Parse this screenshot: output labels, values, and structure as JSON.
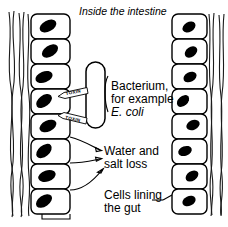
{
  "diagram": {
    "title": "Inside the intestine",
    "background_color": "#ffffff",
    "ink_color": "#000000",
    "labels": {
      "bacterium_line1": "Bacterium,",
      "bacterium_line2": "for example",
      "bacterium_line3": "E. coli",
      "water_salt_line1": "Water and",
      "water_salt_line2": "salt loss",
      "cells_lining_line1": "Cells lining",
      "cells_lining_line2": "the gut",
      "toxin_1": "TOXIN",
      "toxin_2": "TOXIN"
    },
    "left_column": {
      "name": "left epithelial cell column",
      "cell_count": 8,
      "cells": [
        {
          "index": 1,
          "nucleus_angle": -28
        },
        {
          "index": 2,
          "nucleus_angle": -34
        },
        {
          "index": 3,
          "nucleus_angle": -22
        },
        {
          "index": 4,
          "nucleus_angle": -38
        },
        {
          "index": 5,
          "nucleus_angle": -25
        },
        {
          "index": 6,
          "nucleus_angle": -40
        },
        {
          "index": 7,
          "nucleus_angle": -18
        },
        {
          "index": 8,
          "nucleus_angle": -35
        }
      ]
    },
    "right_column": {
      "name": "right epithelial cell column",
      "cell_count": 8,
      "cells": [
        {
          "index": 1,
          "nucleus_angle": -30
        },
        {
          "index": 2,
          "nucleus_angle": -36
        },
        {
          "index": 3,
          "nucleus_angle": -28
        },
        {
          "index": 4,
          "nucleus_angle": -42
        },
        {
          "index": 5,
          "nucleus_angle": -24
        },
        {
          "index": 6,
          "nucleus_angle": -20
        },
        {
          "index": 7,
          "nucleus_angle": -34
        },
        {
          "index": 8,
          "nucleus_angle": -26
        }
      ]
    },
    "bacterium": {
      "name": "bacterium capsule",
      "shape": "rod",
      "fill": "#ffffff"
    },
    "arrow_count": 3,
    "fibers": {
      "left_count": 5,
      "right_count": 4
    }
  }
}
